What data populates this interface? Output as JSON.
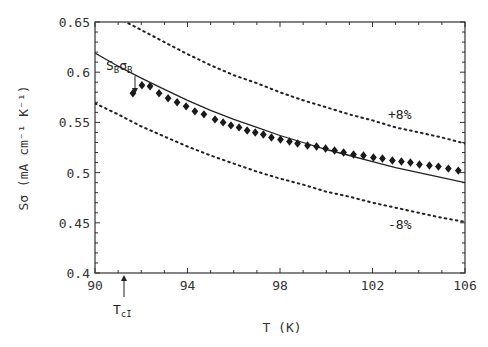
{
  "chart_data": {
    "type": "scatter",
    "title": "",
    "xlabel": "T (K)",
    "ylabel": "Sσ (mA cm⁻¹ K⁻¹)",
    "xlim": [
      90,
      106
    ],
    "ylim": [
      0.4,
      0.65
    ],
    "x_ticks": [
      "90",
      "94",
      "98",
      "102",
      "106"
    ],
    "x_tick_values": [
      90,
      94,
      98,
      102,
      106
    ],
    "y_ticks": [
      "0.4",
      "0.45",
      "0.5",
      "0.55",
      "0.6",
      "0.65"
    ],
    "y_tick_values": [
      0.4,
      0.45,
      0.5,
      0.55,
      0.6,
      0.65
    ],
    "grid": false,
    "series": [
      {
        "name": "measured",
        "style": "diamond-markers",
        "x": [
          91.64,
          92.03,
          92.38,
          92.77,
          93.16,
          93.55,
          93.94,
          94.32,
          94.71,
          95.19,
          95.54,
          95.88,
          96.23,
          96.58,
          96.93,
          97.28,
          97.63,
          98.02,
          98.41,
          98.76,
          99.19,
          99.58,
          99.97,
          100.36,
          100.75,
          101.18,
          101.61,
          102.04,
          102.43,
          102.86,
          103.25,
          103.64,
          104.03,
          104.46,
          104.85,
          105.28,
          105.71
        ],
        "y": [
          0.579,
          0.587,
          0.586,
          0.579,
          0.574,
          0.57,
          0.566,
          0.561,
          0.558,
          0.553,
          0.55,
          0.547,
          0.545,
          0.542,
          0.54,
          0.538,
          0.535,
          0.533,
          0.531,
          0.529,
          0.527,
          0.526,
          0.524,
          0.522,
          0.52,
          0.518,
          0.517,
          0.515,
          0.514,
          0.512,
          0.511,
          0.51,
          0.508,
          0.507,
          0.506,
          0.504,
          0.502
        ]
      },
      {
        "name": "S_B σ_B",
        "style": "solid-line",
        "x": [
          90,
          91,
          92,
          93,
          94,
          95,
          96,
          97,
          98,
          99,
          100,
          101,
          102,
          103,
          104,
          105,
          106
        ],
        "y": [
          0.619,
          0.606,
          0.594,
          0.583,
          0.572,
          0.562,
          0.553,
          0.545,
          0.537,
          0.53,
          0.523,
          0.517,
          0.511,
          0.505,
          0.5,
          0.495,
          0.49
        ]
      },
      {
        "name": "+8%",
        "style": "dotted-line",
        "x": [
          90,
          91,
          92,
          93,
          94,
          95,
          96,
          97,
          98,
          99,
          100,
          101,
          102,
          103,
          104,
          105,
          106
        ],
        "y": [
          0.669,
          0.654,
          0.642,
          0.63,
          0.618,
          0.607,
          0.597,
          0.589,
          0.58,
          0.572,
          0.565,
          0.558,
          0.552,
          0.545,
          0.54,
          0.535,
          0.529
        ]
      },
      {
        "name": "-8%",
        "style": "dotted-line",
        "x": [
          90,
          91,
          92,
          93,
          94,
          95,
          96,
          97,
          98,
          99,
          100,
          101,
          102,
          103,
          104,
          105,
          106
        ],
        "y": [
          0.569,
          0.558,
          0.546,
          0.536,
          0.526,
          0.517,
          0.509,
          0.501,
          0.494,
          0.488,
          0.481,
          0.476,
          0.47,
          0.465,
          0.46,
          0.455,
          0.451
        ]
      }
    ],
    "annotations": [
      {
        "text_main": "S",
        "text_sub": "B",
        "text_main2": "σ",
        "text_sub2": "B",
        "label": "S_B σ_B",
        "x": 92.3,
        "y": 0.617,
        "arrow_to": [
          92.1,
          0.598
        ]
      },
      {
        "label": "+8%",
        "x": 103.3,
        "y": 0.563
      },
      {
        "label": "-8%",
        "x": 103.3,
        "y": 0.475
      },
      {
        "text_main": "T",
        "text_sub": "cI",
        "label": "T_cI",
        "x": 91.2,
        "arrow_from_y": "below-axis"
      }
    ],
    "legend": "none (inline annotations)"
  }
}
